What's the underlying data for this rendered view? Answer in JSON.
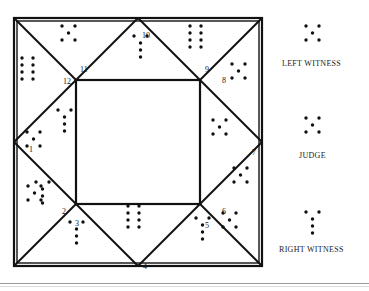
{
  "page": {
    "top_caption": "",
    "background": "#ffffff",
    "ink": "#111111"
  },
  "diagram": {
    "name": "courtroom-seating-quadrant-diagram",
    "outer_square": {
      "x": 14,
      "y": 18,
      "w": 248,
      "h": 248
    },
    "inner_square": {
      "x": 76,
      "y": 80,
      "w": 124,
      "h": 124
    },
    "line_color": "#111111",
    "line_width": 2,
    "station_numbers": [
      {
        "id": "1",
        "x": 29,
        "y": 145
      },
      {
        "id": "2",
        "x": 62,
        "y": 207
      },
      {
        "id": "3",
        "x": 75,
        "y": 219
      },
      {
        "id": "4",
        "x": 143,
        "y": 262
      },
      {
        "id": "5",
        "x": 205,
        "y": 221
      },
      {
        "id": "6",
        "x": 222,
        "y": 207
      },
      {
        "id": "7",
        "x": 252,
        "y": 148
      },
      {
        "id": "8",
        "x": 222,
        "y": 76
      },
      {
        "id": "9",
        "x": 205,
        "y": 65
      },
      {
        "id": "10",
        "x": 142,
        "y": 31
      },
      {
        "id": "11",
        "x": 80,
        "y": 65
      },
      {
        "id": "12",
        "x": 63,
        "y": 77
      }
    ],
    "dot_clusters": [
      {
        "name": "cluster-eight-upper-left",
        "pattern": "8-two-columns",
        "x": 22,
        "y": 58,
        "dot_r": 1.7
      },
      {
        "name": "cluster-five-top-left",
        "pattern": "5-quincunx",
        "x": 62,
        "y": 26,
        "dot_r": 1.7
      },
      {
        "name": "cluster-five-top-center",
        "pattern": "5-arrow-down",
        "x": 134,
        "y": 36,
        "dot_r": 1.7
      },
      {
        "name": "cluster-eight-top-right",
        "pattern": "8-two-columns",
        "x": 190,
        "y": 26,
        "dot_r": 1.7
      },
      {
        "name": "cluster-five-right-upper",
        "pattern": "5-quincunx",
        "x": 232,
        "y": 64,
        "dot_r": 1.7
      },
      {
        "name": "cluster-five-left-upper",
        "pattern": "5-arrow-down",
        "x": 58,
        "y": 110,
        "dot_r": 1.7
      },
      {
        "name": "cluster-five-left-mid",
        "pattern": "5-quincunx",
        "x": 27,
        "y": 132,
        "dot_r": 1.7
      },
      {
        "name": "cluster-five-right-mid",
        "pattern": "5-quincunx",
        "x": 213,
        "y": 120,
        "dot_r": 1.7
      },
      {
        "name": "cluster-five-left-lower",
        "pattern": "5-quincunx",
        "x": 28,
        "y": 186,
        "dot_r": 1.7
      },
      {
        "name": "cluster-five-bottom-left",
        "pattern": "5-arrow-down",
        "x": 36,
        "y": 182,
        "dot_r": 1.7
      },
      {
        "name": "cluster-five-below-three",
        "pattern": "5-arrow-down",
        "x": 70,
        "y": 222,
        "dot_r": 1.7
      },
      {
        "name": "cluster-eight-bottom-mid",
        "pattern": "8-two-columns",
        "x": 128,
        "y": 206,
        "dot_r": 1.7
      },
      {
        "name": "cluster-five-bottom-right",
        "pattern": "5-arrow-down",
        "x": 196,
        "y": 218,
        "dot_r": 1.7
      },
      {
        "name": "cluster-five-right-lower",
        "pattern": "5-quincunx",
        "x": 223,
        "y": 213,
        "dot_r": 1.7
      },
      {
        "name": "cluster-five-right-edge",
        "pattern": "5-quincunx",
        "x": 234,
        "y": 168,
        "dot_r": 1.7
      }
    ]
  },
  "legend": {
    "left_witness": {
      "label": "LEFT WITNESS",
      "label_x": 282,
      "label_y": 64,
      "cluster_x": 306,
      "cluster_y": 26,
      "pattern": "5-quincunx"
    },
    "judge": {
      "label": "JUDGE",
      "label_x": 299,
      "label_y": 156,
      "cluster_x": 306,
      "cluster_y": 118,
      "pattern": "5-quincunx"
    },
    "right_witness": {
      "label": "RIGHT WITNESS",
      "label_x": 279,
      "label_y": 250,
      "cluster_x": 306,
      "cluster_y": 212,
      "pattern": "5-arrow-down"
    }
  }
}
